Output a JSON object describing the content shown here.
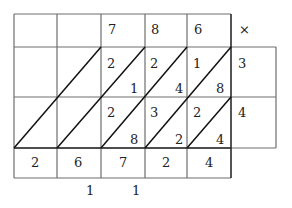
{
  "diagram": {
    "type": "lattice-multiplication",
    "multiplicand_digits": [
      "7",
      "8",
      "6"
    ],
    "operator_symbol": "×",
    "multiplier_digits": [
      "3",
      "4"
    ],
    "cells": [
      [
        {
          "tens": "2",
          "ones": "1"
        },
        {
          "tens": "2",
          "ones": "4"
        },
        {
          "tens": "1",
          "ones": "8"
        }
      ],
      [
        {
          "tens": "2",
          "ones": "8"
        },
        {
          "tens": "3",
          "ones": "2"
        },
        {
          "tens": "2",
          "ones": "4"
        }
      ]
    ],
    "result_digits": [
      "2",
      "6",
      "7",
      "2",
      "4"
    ],
    "carries": [
      "1",
      "1"
    ]
  }
}
